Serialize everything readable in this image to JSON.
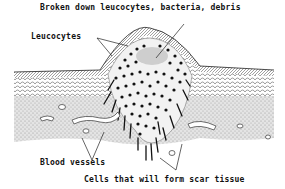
{
  "diagram": {
    "labels": {
      "top": "Broken down leucocytes, bacteria, debris",
      "left": "Leucocytes",
      "bottom_left": "Blood vessels",
      "bottom_right": "Cells that will form scar tissue"
    },
    "colors": {
      "ink": "#111111",
      "tissue_shade": "#9a9a9a",
      "background": "#ffffff"
    }
  }
}
